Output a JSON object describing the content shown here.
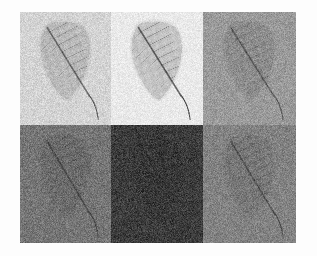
{
  "figure": {
    "width": 317,
    "height": 256,
    "page_background": "#f7f7f7",
    "outer_background": "#fdfdfd",
    "grid": {
      "rows": 2,
      "cols": 3,
      "x": 20,
      "y": 12,
      "width": 276,
      "height": 231,
      "col_edges": [
        20,
        111,
        203,
        296
      ],
      "row_edges": [
        12,
        125,
        243
      ]
    },
    "subject": {
      "name": "leaf",
      "shape": "ovate",
      "orientation": "tip pointing down-right",
      "features": [
        "midrib",
        "lateral-veins",
        "petiole",
        "lamina"
      ],
      "vein_color": "#2f2f2f",
      "lamina_darkening": 0.16,
      "noise_amount": 0.085
    },
    "panels": [
      {
        "index": 1,
        "position": "top-left",
        "label": "(a)",
        "background": "#d3d3d3",
        "brightness": 211,
        "leaf_tone": "#b0b0b0",
        "vein_strength": 0.72,
        "noise": 0.075,
        "contrast": 0.85
      },
      {
        "index": 2,
        "position": "top-middle",
        "label": "(b)",
        "background": "#e9e9e9",
        "brightness": 233,
        "leaf_tone": "#bdbdbd",
        "vein_strength": 0.86,
        "noise": 0.055,
        "contrast": 1.0
      },
      {
        "index": 3,
        "position": "top-right",
        "label": "(c)",
        "background": "#9a9a9a",
        "brightness": 154,
        "leaf_tone": "#848484",
        "vein_strength": 0.62,
        "noise": 0.09,
        "contrast": 0.7
      },
      {
        "index": 4,
        "position": "bottom-left",
        "label": "(d)",
        "background": "#757575",
        "brightness": 117,
        "leaf_tone": "#636363",
        "vein_strength": 0.68,
        "noise": 0.1,
        "contrast": 0.62
      },
      {
        "index": 5,
        "position": "bottom-middle",
        "label": "(e)",
        "background": "#3c3c3c",
        "brightness": 60,
        "leaf_tone": "#323232",
        "vein_strength": 0.9,
        "noise": 0.11,
        "contrast": 0.5
      },
      {
        "index": 6,
        "position": "bottom-right",
        "label": "(f)",
        "background": "#828282",
        "brightness": 130,
        "leaf_tone": "#707070",
        "vein_strength": 0.66,
        "noise": 0.095,
        "contrast": 0.66
      }
    ]
  }
}
